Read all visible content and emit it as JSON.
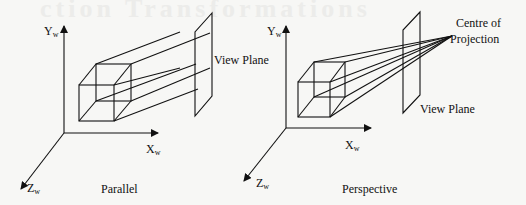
{
  "background_text": "ction Transformations",
  "parallel": {
    "caption": "Parallel",
    "y_axis": {
      "main": "Y",
      "sub": "w"
    },
    "x_axis": {
      "main": "X",
      "sub": "w"
    },
    "z_axis": {
      "main": "Z",
      "sub": "w"
    },
    "plane_label": "View Plane"
  },
  "perspective": {
    "caption": "Perspective",
    "y_axis": {
      "main": "Y",
      "sub": "w"
    },
    "x_axis": {
      "main": "X",
      "sub": "w"
    },
    "z_axis": {
      "main": "Z",
      "sub": "w"
    },
    "plane_label": "View Plane",
    "cop_label_line1": "Centre of",
    "cop_label_line2": "Projection"
  },
  "colors": {
    "line": "#111111",
    "background": "#f7f7f5"
  }
}
